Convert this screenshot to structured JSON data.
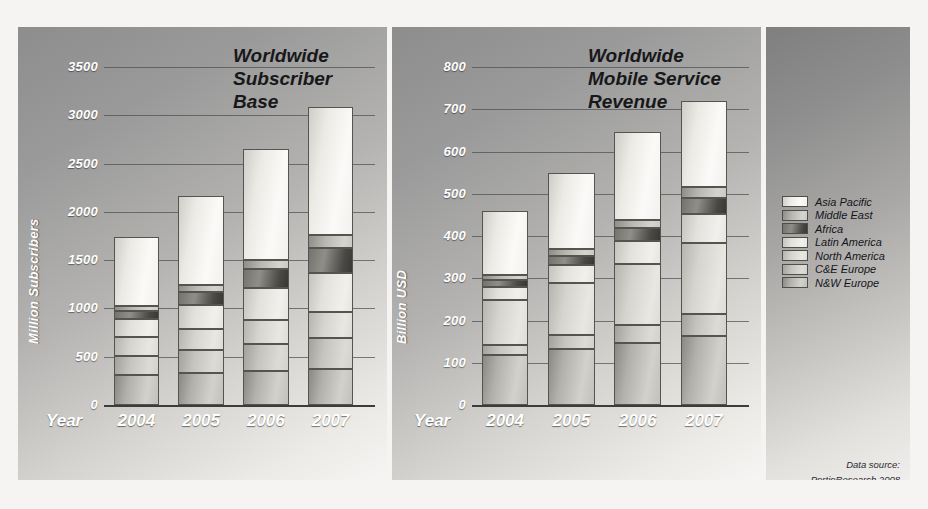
{
  "figure": {
    "background_color": "#f5f4f2",
    "source_line1": "Data source:",
    "source_line2": "PortioResearch 2008"
  },
  "legend": {
    "title": "",
    "entries": [
      {
        "label": "Asia Pacific",
        "key": "s-ap"
      },
      {
        "label": "Middle East",
        "key": "s-me"
      },
      {
        "label": "Africa",
        "key": "s-af"
      },
      {
        "label": "Latin America",
        "key": "s-la"
      },
      {
        "label": "North America",
        "key": "s-na"
      },
      {
        "label": "C&E Europe",
        "key": "s-ce"
      },
      {
        "label": "N&W Europe",
        "key": "s-nw"
      }
    ]
  },
  "chart_data": [
    {
      "type": "bar",
      "stacked": true,
      "title": "Worldwide\nSubscriber\nBase",
      "xlabel": "Year",
      "ylabel": "Million Subscribers",
      "categories": [
        "2004",
        "2005",
        "2006",
        "2007"
      ],
      "ylim": [
        0,
        3500
      ],
      "yticks": [
        0,
        500,
        1000,
        1500,
        2000,
        2500,
        3000,
        3500
      ],
      "ytick_labels": [
        "0",
        "500",
        "1000",
        "1500",
        "2000",
        "2500",
        "3000",
        "3500"
      ],
      "grid": true,
      "legend_position": "right-panel",
      "series": [
        {
          "name": "N&W Europe",
          "values": [
            310,
            330,
            350,
            370
          ]
        },
        {
          "name": "C&E Europe",
          "values": [
            195,
            240,
            285,
            320
          ]
        },
        {
          "name": "North America",
          "values": [
            195,
            215,
            250,
            275
          ]
        },
        {
          "name": "Latin America",
          "values": [
            190,
            255,
            330,
            400
          ]
        },
        {
          "name": "Africa",
          "values": [
            80,
            125,
            190,
            265
          ]
        },
        {
          "name": "Middle East",
          "values": [
            55,
            75,
            100,
            130
          ]
        },
        {
          "name": "Asia Pacific",
          "values": [
            715,
            920,
            1145,
            1325
          ]
        }
      ],
      "totals": [
        1740,
        2160,
        2650,
        3085
      ]
    },
    {
      "type": "bar",
      "stacked": true,
      "title": "Worldwide\nMobile Service\nRevenue",
      "xlabel": "Year",
      "ylabel": "Billion USD",
      "categories": [
        "2004",
        "2005",
        "2006",
        "2007"
      ],
      "ylim": [
        0,
        800
      ],
      "yticks": [
        0,
        100,
        200,
        300,
        400,
        500,
        600,
        700,
        800
      ],
      "ytick_labels": [
        "0",
        "100",
        "200",
        "300",
        "400",
        "500",
        "600",
        "700",
        "800"
      ],
      "grid": true,
      "legend_position": "right-panel",
      "series": [
        {
          "name": "N&W Europe",
          "values": [
            118,
            132,
            147,
            163
          ]
        },
        {
          "name": "C&E Europe",
          "values": [
            25,
            33,
            42,
            53
          ]
        },
        {
          "name": "North America",
          "values": [
            105,
            123,
            145,
            168
          ]
        },
        {
          "name": "Latin America",
          "values": [
            32,
            43,
            55,
            68
          ]
        },
        {
          "name": "Africa",
          "values": [
            16,
            22,
            29,
            38
          ]
        },
        {
          "name": "Middle East",
          "values": [
            12,
            16,
            21,
            27
          ]
        },
        {
          "name": "Asia Pacific",
          "values": [
            152,
            181,
            206,
            203
          ]
        }
      ],
      "totals": [
        460,
        550,
        645,
        720
      ]
    }
  ]
}
